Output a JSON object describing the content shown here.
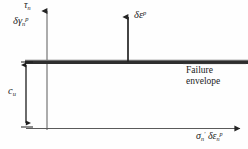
{
  "figure": {
    "type": "technical-line-diagram",
    "width": 248,
    "height": 149,
    "background_color": "#fefefe",
    "line_color": "#2b2b2b"
  },
  "axes": {
    "vertical": {
      "name": "shear-stress-axis",
      "label_plain": "tau_n",
      "label_symbol": "τ",
      "label_sub": "n",
      "x": 47,
      "y_top": 8,
      "y_bottom": 130,
      "arrow": "up"
    },
    "horizontal": {
      "name": "effective-normal-stress-axis",
      "label_plain": "sigma_n' delta epsilon_n^p",
      "sigma_symbol": "σ",
      "sigma_sub": "n",
      "sigma_prime": "′",
      "delta_symbol": "δ",
      "epsilon_symbol": "ε",
      "epsilon_sub": "n",
      "epsilon_sup": "p",
      "y": 128,
      "x_left": 26,
      "x_right": 243,
      "arrow": "right"
    }
  },
  "labels": {
    "plastic_shear_strain": {
      "plain": "delta gamma_n^p",
      "delta_symbol": "δ",
      "gamma_symbol": "γ",
      "sub": "n",
      "sup": "p"
    },
    "plastic_strain_increment": {
      "plain": "delta epsilon^p",
      "delta_symbol": "δ",
      "epsilon_symbol": "ε",
      "sup": "p"
    },
    "undrained_strength": {
      "plain": "c_u",
      "symbol": "c",
      "sub": "u"
    },
    "failure_envelope": {
      "line1": "Failure",
      "line2": "envelope"
    }
  },
  "elements": {
    "failure_envelope_line": {
      "name": "failure-envelope-line",
      "y": 62,
      "x_left": 25,
      "x_right": 248,
      "thickness": 4
    },
    "flow_vector_arrow": {
      "name": "plastic-strain-increment-arrow",
      "x": 128,
      "y_tail": 62,
      "y_head": 14,
      "direction": "up"
    },
    "cu_dimension_arrow": {
      "name": "cu-dimension-arrow",
      "x": 26,
      "y_top": 62,
      "y_bottom": 126,
      "double_headed": true
    }
  }
}
